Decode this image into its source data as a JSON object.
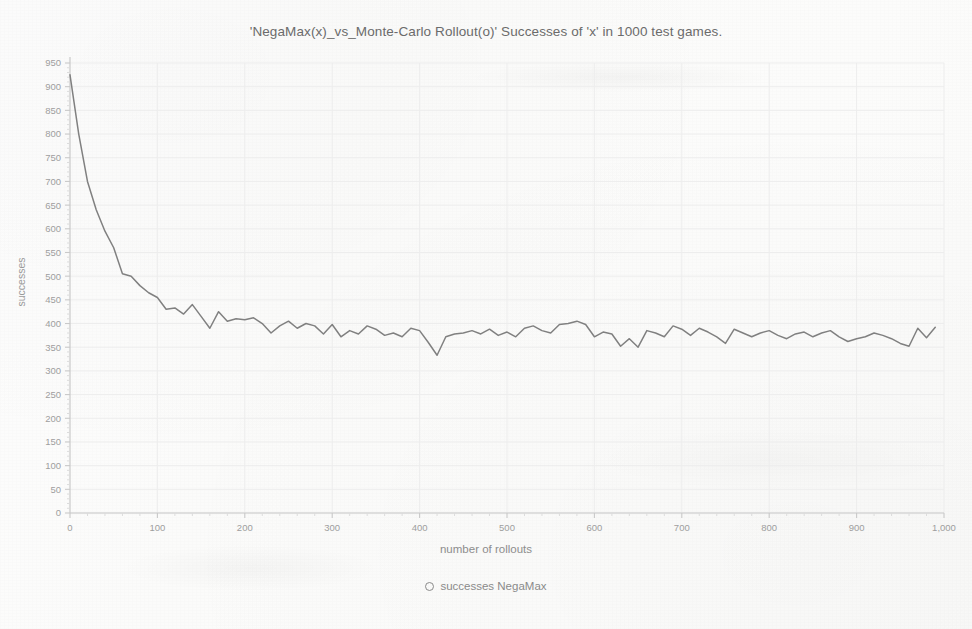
{
  "chart_data": {
    "type": "line",
    "title": "'NegaMax(x)_vs_Monte-Carlo Rollout(o)'  Successes of 'x' in 1000 test games.",
    "xlabel": "number of rollouts",
    "ylabel": "successes",
    "xlim": [
      0,
      1000
    ],
    "ylim": [
      0,
      950
    ],
    "grid": true,
    "legend_position": "bottom-center",
    "series": [
      {
        "name": "successes NegaMax",
        "marker": "circle-open",
        "color": "#808080",
        "x": [
          0,
          10,
          20,
          30,
          40,
          50,
          60,
          70,
          80,
          90,
          100,
          110,
          120,
          130,
          140,
          150,
          160,
          170,
          180,
          190,
          200,
          210,
          220,
          230,
          240,
          250,
          260,
          270,
          280,
          290,
          300,
          310,
          320,
          330,
          340,
          350,
          360,
          370,
          380,
          390,
          400,
          410,
          420,
          430,
          440,
          450,
          460,
          470,
          480,
          490,
          500,
          510,
          520,
          530,
          540,
          550,
          560,
          570,
          580,
          590,
          600,
          610,
          620,
          630,
          640,
          650,
          660,
          670,
          680,
          690,
          700,
          710,
          720,
          730,
          740,
          750,
          760,
          770,
          780,
          790,
          800,
          810,
          820,
          830,
          840,
          850,
          860,
          870,
          880,
          890,
          900,
          910,
          920,
          930,
          940,
          950,
          960,
          970,
          980,
          990
        ],
        "y": [
          925,
          800,
          700,
          640,
          595,
          560,
          505,
          500,
          480,
          465,
          455,
          430,
          433,
          420,
          440,
          415,
          390,
          425,
          405,
          410,
          408,
          412,
          400,
          380,
          395,
          405,
          390,
          400,
          395,
          378,
          398,
          372,
          385,
          378,
          395,
          388,
          375,
          380,
          372,
          390,
          385,
          360,
          333,
          372,
          378,
          380,
          385,
          378,
          388,
          375,
          382,
          372,
          390,
          395,
          385,
          380,
          398,
          400,
          405,
          398,
          372,
          382,
          378,
          352,
          368,
          350,
          385,
          380,
          372,
          395,
          388,
          375,
          390,
          382,
          372,
          358,
          388,
          380,
          372,
          380,
          385,
          375,
          368,
          378,
          382,
          372,
          380,
          385,
          372,
          362,
          368,
          372,
          380,
          375,
          368,
          358,
          352,
          390,
          370,
          392
        ]
      }
    ],
    "x_ticks": [
      {
        "value": 0,
        "label": "0"
      },
      {
        "value": 100,
        "label": "100"
      },
      {
        "value": 200,
        "label": "200"
      },
      {
        "value": 300,
        "label": "300"
      },
      {
        "value": 400,
        "label": "400"
      },
      {
        "value": 500,
        "label": "500"
      },
      {
        "value": 600,
        "label": "600"
      },
      {
        "value": 700,
        "label": "700"
      },
      {
        "value": 800,
        "label": "800"
      },
      {
        "value": 900,
        "label": "900"
      },
      {
        "value": 1000,
        "label": "1,000"
      }
    ],
    "y_ticks": [
      {
        "value": 0,
        "label": "0"
      },
      {
        "value": 50,
        "label": "50"
      },
      {
        "value": 100,
        "label": "100"
      },
      {
        "value": 150,
        "label": "150"
      },
      {
        "value": 200,
        "label": "200"
      },
      {
        "value": 250,
        "label": "250"
      },
      {
        "value": 300,
        "label": "300"
      },
      {
        "value": 350,
        "label": "350"
      },
      {
        "value": 400,
        "label": "400"
      },
      {
        "value": 450,
        "label": "450"
      },
      {
        "value": 500,
        "label": "500"
      },
      {
        "value": 550,
        "label": "550"
      },
      {
        "value": 600,
        "label": "600"
      },
      {
        "value": 650,
        "label": "650"
      },
      {
        "value": 700,
        "label": "700"
      },
      {
        "value": 750,
        "label": "750"
      },
      {
        "value": 800,
        "label": "800"
      },
      {
        "value": 850,
        "label": "850"
      },
      {
        "value": 900,
        "label": "900"
      },
      {
        "value": 950,
        "label": "950"
      }
    ]
  },
  "legend": {
    "entries": [
      {
        "label": "successes NegaMax",
        "marker": "circle-open-icon"
      }
    ]
  },
  "colors": {
    "line": "#808080",
    "axis": "#c9c9c9",
    "grid": "#ededed",
    "title_text": "#6b6b6b",
    "tick_text": "#9e9e9e",
    "label_text": "#8d8d8d"
  }
}
